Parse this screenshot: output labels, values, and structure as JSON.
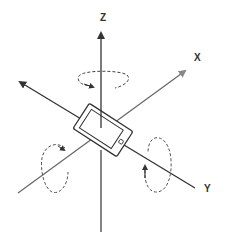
{
  "diagram": {
    "axes": [
      {
        "name": "Z",
        "label": "Z",
        "direction": "vertical"
      },
      {
        "name": "X",
        "label": "X",
        "direction": "diagonal lower-left to upper-right"
      },
      {
        "name": "Y",
        "label": "Y",
        "direction": "diagonal upper-left to lower-right"
      }
    ],
    "rotations": [
      {
        "axis": "Z",
        "style": "dashed ellipse"
      },
      {
        "axis": "X",
        "style": "dashed loop"
      },
      {
        "axis": "Y",
        "style": "dashed loop"
      }
    ],
    "device": "phone-icon",
    "colors": {
      "axis": "#333333",
      "dashed": "#555555",
      "background": "#ffffff"
    }
  }
}
